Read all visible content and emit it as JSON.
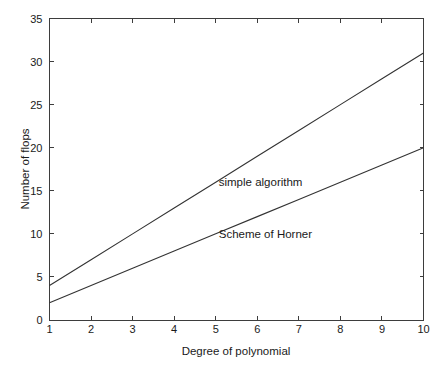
{
  "chart_data": {
    "type": "line",
    "title": "",
    "xlabel": "Degree of polynomial",
    "ylabel": "Number of flops",
    "xlim": [
      1,
      10
    ],
    "ylim": [
      0,
      35
    ],
    "xticks": [
      1,
      2,
      3,
      4,
      5,
      6,
      7,
      8,
      9,
      10
    ],
    "xticklabels": [
      "1",
      "2",
      "3",
      "4",
      "5",
      "6",
      "7",
      "8",
      "9",
      "10"
    ],
    "yticks": [
      0,
      5,
      10,
      15,
      20,
      25,
      30,
      35
    ],
    "yticklabels": [
      "0",
      "5",
      "10",
      "15",
      "20",
      "25",
      "30",
      "35"
    ],
    "grid": false,
    "legend": "inline-annotations",
    "x": [
      1,
      2,
      3,
      4,
      5,
      6,
      7,
      8,
      9,
      10
    ],
    "series": [
      {
        "name": "simple algorithm",
        "values": [
          4,
          7,
          10,
          13,
          16,
          19,
          22,
          25,
          28,
          31
        ],
        "color": "#333333",
        "annotation": {
          "text": "simple algorithm",
          "x": 5.0,
          "y": 16.0
        }
      },
      {
        "name": "Scheme of Horner",
        "values": [
          2,
          4,
          6,
          8,
          10,
          12,
          14,
          16,
          18,
          20
        ],
        "color": "#333333",
        "annotation": {
          "text": "Scheme of Horner",
          "x": 5.0,
          "y": 10.0
        }
      }
    ]
  },
  "figure": {
    "background": "#ffffff",
    "axis_color": "#3d3d3d"
  }
}
